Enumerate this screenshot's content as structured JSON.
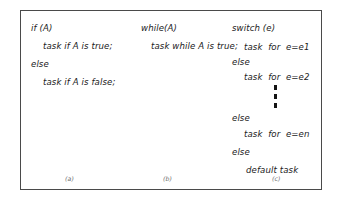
{
  "figure": {
    "caption_style": "lettered",
    "border_color": "#4a4a4a",
    "background_color": "#ffffff",
    "text_color": "#1b1b1b",
    "caption_color": "#6e6e6e"
  },
  "columns": [
    {
      "id": "a",
      "caption": "(a)",
      "construct": "if",
      "lines": [
        {
          "text": "if (A)",
          "indent": 0
        },
        {
          "text": "task if A is true;",
          "indent": 1
        },
        {
          "text": "else",
          "indent": 0
        },
        {
          "text": "task if A is false;",
          "indent": 1
        }
      ]
    },
    {
      "id": "b",
      "caption": "(b)",
      "construct": "while",
      "lines": [
        {
          "text": "while(A)",
          "indent": 0
        },
        {
          "text": "task while A is true;",
          "indent": 1
        }
      ]
    },
    {
      "id": "c",
      "caption": "(c)",
      "construct": "switch",
      "lines": [
        {
          "text": "switch (e)",
          "indent": 0
        },
        {
          "text": "task  for  e=e1",
          "indent": 1
        },
        {
          "text": "else",
          "indent": 0
        },
        {
          "text": "task  for  e=e2",
          "indent": 1
        },
        {
          "text": "else",
          "indent": 0
        },
        {
          "text": "task  for  e=en",
          "indent": 1
        },
        {
          "text": "else",
          "indent": 0
        },
        {
          "text": "default task",
          "indent": 1
        }
      ],
      "ellipsis": "vertical-dots"
    }
  ]
}
